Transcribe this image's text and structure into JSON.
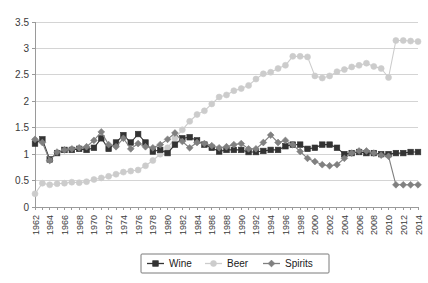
{
  "chart_data": {
    "type": "line",
    "title": "",
    "subtitle": "",
    "xlabel": "",
    "ylabel": "",
    "ylim": [
      0,
      3.5
    ],
    "ytick_labels": [
      "0",
      "0.5",
      "1",
      "1.5",
      "2",
      "2.5",
      "3",
      "3.5"
    ],
    "ytick_values": [
      0,
      0.5,
      1,
      1.5,
      2,
      2.5,
      3,
      3.5
    ],
    "grid": true,
    "legend_position": "bottom-center",
    "x": [
      1962,
      1963,
      1964,
      1965,
      1966,
      1967,
      1968,
      1969,
      1970,
      1971,
      1972,
      1973,
      1974,
      1975,
      1976,
      1977,
      1978,
      1979,
      1980,
      1981,
      1982,
      1983,
      1984,
      1985,
      1986,
      1987,
      1988,
      1989,
      1990,
      1991,
      1992,
      1993,
      1994,
      1995,
      1996,
      1997,
      1998,
      1999,
      2000,
      2001,
      2002,
      2003,
      2004,
      2005,
      2006,
      2007,
      2008,
      2009,
      2010,
      2011,
      2012,
      2013,
      2014
    ],
    "xtick_labels": [
      "1962",
      "1964",
      "1966",
      "1968",
      "1970",
      "1972",
      "1974",
      "1976",
      "1978",
      "1980",
      "1982",
      "1984",
      "1986",
      "1988",
      "1990",
      "1992",
      "1994",
      "1996",
      "1998",
      "2000",
      "2002",
      "2004",
      "2006",
      "2008",
      "2010",
      "2012",
      "2014"
    ],
    "series": [
      {
        "name": "Wine",
        "color": "#333333",
        "marker": "square",
        "values": [
          1.2,
          1.28,
          0.9,
          1.02,
          1.08,
          1.08,
          1.1,
          1.08,
          1.12,
          1.3,
          1.1,
          1.22,
          1.36,
          1.22,
          1.38,
          1.22,
          1.05,
          1.08,
          1.02,
          1.18,
          1.3,
          1.32,
          1.26,
          1.18,
          1.12,
          1.05,
          1.08,
          1.08,
          1.08,
          1.04,
          1.04,
          1.06,
          1.08,
          1.08,
          1.15,
          1.18,
          1.18,
          1.1,
          1.12,
          1.18,
          1.18,
          1.12,
          1.0,
          1.02,
          1.04,
          1.02,
          1.02,
          1.0,
          1.0,
          1.02,
          1.02,
          1.04,
          1.04
        ]
      },
      {
        "name": "Beer",
        "color": "#cccccc",
        "marker": "circle",
        "values": [
          0.25,
          0.45,
          0.42,
          0.44,
          0.45,
          0.47,
          0.46,
          0.48,
          0.52,
          0.55,
          0.58,
          0.62,
          0.66,
          0.68,
          0.7,
          0.78,
          0.88,
          1.0,
          1.12,
          1.3,
          1.46,
          1.62,
          1.75,
          1.82,
          1.95,
          2.08,
          2.12,
          2.2,
          2.24,
          2.3,
          2.42,
          2.52,
          2.55,
          2.62,
          2.68,
          2.85,
          2.85,
          2.84,
          2.48,
          2.44,
          2.48,
          2.56,
          2.6,
          2.65,
          2.68,
          2.72,
          2.66,
          2.62,
          2.45,
          3.15,
          3.15,
          3.14,
          3.13
        ]
      },
      {
        "name": "Spirits",
        "color": "#808080",
        "marker": "diamond",
        "values": [
          1.28,
          1.22,
          0.88,
          1.04,
          1.08,
          1.1,
          1.12,
          1.14,
          1.26,
          1.42,
          1.18,
          1.14,
          1.3,
          1.1,
          1.2,
          1.14,
          1.12,
          1.18,
          1.28,
          1.4,
          1.24,
          1.12,
          1.22,
          1.2,
          1.16,
          1.12,
          1.14,
          1.18,
          1.2,
          1.1,
          1.1,
          1.22,
          1.36,
          1.22,
          1.26,
          1.18,
          1.05,
          0.92,
          0.86,
          0.8,
          0.78,
          0.8,
          0.92,
          1.02,
          1.06,
          1.06,
          1.02,
          0.98,
          0.96,
          0.42,
          0.42,
          0.42,
          0.42
        ]
      }
    ]
  },
  "legend": {
    "items": [
      {
        "label": "Wine"
      },
      {
        "label": "Beer"
      },
      {
        "label": "Spirits"
      }
    ]
  }
}
